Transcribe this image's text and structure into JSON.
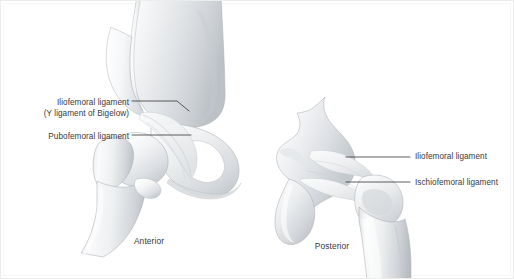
{
  "figure": {
    "background_color": "#ffffff",
    "border_color": "#ececec",
    "text_color": "#3a3a3a",
    "leader_line_color": "#2a2a2a",
    "bone_highlight_color": "#fdfdfd",
    "bone_midtone_color": "#dcdfe2",
    "bone_shadow_color": "#b8bcc0",
    "bone_outline_color": "#9aa0a5"
  },
  "views": {
    "anterior": {
      "caption": "Anterior",
      "labels": [
        {
          "id": "iliofemoral",
          "line1": "Iliofemoral ligament",
          "line2": "(Y ligament of Bigelow)"
        },
        {
          "id": "pubofemoral",
          "line1": "Pubofemoral ligament",
          "line2": ""
        }
      ]
    },
    "posterior": {
      "caption": "Posterior",
      "labels": [
        {
          "id": "iliofemoral",
          "line1": "Iliofemoral ligament",
          "line2": ""
        },
        {
          "id": "ischiofemoral",
          "line1": "Ischiofemoral ligament",
          "line2": ""
        }
      ]
    }
  },
  "labels": {
    "anterior_iliofemoral_l1": "Iliofemoral ligament",
    "anterior_iliofemoral_l2": "(Y ligament of Bigelow)",
    "anterior_pubofemoral": "Pubofemoral ligament",
    "posterior_iliofemoral": "Iliofemoral ligament",
    "posterior_ischiofemoral": "Ischiofemoral ligament",
    "caption_anterior": "Anterior",
    "caption_posterior": "Posterior"
  }
}
